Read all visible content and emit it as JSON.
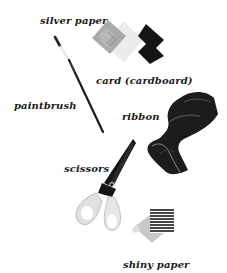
{
  "labels": {
    "silver_paper": "silver paper",
    "card": "card (cardboard)",
    "paintbrush": "paintbrush",
    "ribbon": "ribbon",
    "scissors": "scissors",
    "shiny_paper": "shiny paper"
  },
  "colors": {
    "background": "#ffffff",
    "text": "#1a1a1a",
    "silver": "#a8a8a8",
    "card": "#e8e8e8",
    "black_card": "#141414",
    "ribbon": "#1c1c1c",
    "scissor_blade": "#151515",
    "scissor_handle": "#e2e2e2"
  }
}
